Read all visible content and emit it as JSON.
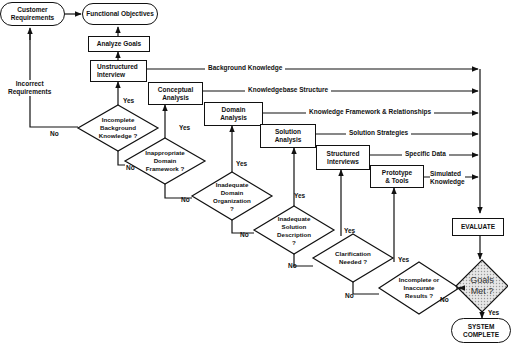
{
  "nodes": {
    "customer_requirements": "Customer\nRequirements",
    "functional_objectives": "Functional Objectives",
    "analyze_goals": "Analyze Goals",
    "unstructured_interview": "Unstructured\nInterview",
    "conceptual_analysis": "Conceptual\nAnalysis",
    "domain_analysis": "Domain\nAnalysis",
    "solution_analysis": "Solution\nAnalysis",
    "structured_interviews": "Structured\nInterviews",
    "prototype_tools": "Prototype\n& Tools",
    "evaluate": "EVALUATE",
    "system_complete": "SYSTEM\nCOMPLETE"
  },
  "decisions": {
    "incomplete_background": "Incomplete\nBackground\nKnowledge ?",
    "inappropriate_domain": "Inappropriate\nDomain\nFramework  ?",
    "inadequate_domain_org": "Inadequate\nDomain\nOrganization\n?",
    "inadequate_solution": "Inadequate\nSolution\nDescription\n?",
    "clarification_needed": "Clarification\nNeeded ?",
    "incomplete_results": "Incomplete or\nInaccurate\nResults ?",
    "goals_met": "Goals\nMet ?"
  },
  "outputs": {
    "background_knowledge": "Background Knowledge",
    "knowledgebase_structure": "Knowledgebase Structure",
    "knowledge_framework": "Knowledge Framework & Relationships",
    "solution_strategies": "Solution Strategies",
    "specific_data": "Specific Data",
    "simulated_knowledge": "Simulated\nKnowledge"
  },
  "labels": {
    "incorrect_requirements": "Incorrect\nRequirements",
    "yes": "Yes",
    "no": "No"
  }
}
